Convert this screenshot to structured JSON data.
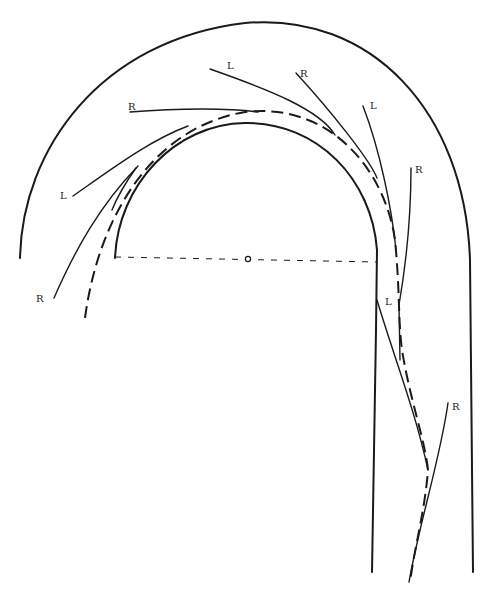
{
  "figure": {
    "type": "track-trajectory-diagram",
    "colors": {
      "line": "#1a1a1a",
      "background": "#ffffff"
    },
    "top_fragment": "",
    "center_marker": {
      "symbol": "circle",
      "x": 248,
      "y": 259
    },
    "labels": [
      {
        "id": "label-r-upper-left",
        "text": "R",
        "x": 128,
        "y": 110
      },
      {
        "id": "label-l-top",
        "text": "L",
        "x": 227,
        "y": 69
      },
      {
        "id": "label-r-top",
        "text": "R",
        "x": 300,
        "y": 77
      },
      {
        "id": "label-l-upper-right",
        "text": "L",
        "x": 370,
        "y": 109
      },
      {
        "id": "label-r-right",
        "text": "R",
        "x": 415,
        "y": 173
      },
      {
        "id": "label-l-left",
        "text": "L",
        "x": 60,
        "y": 199
      },
      {
        "id": "label-r-left",
        "text": "R",
        "x": 36,
        "y": 302
      },
      {
        "id": "label-l-lower-right",
        "text": "L",
        "x": 385,
        "y": 305
      },
      {
        "id": "label-r-lower-right",
        "text": "R",
        "x": 452,
        "y": 410
      }
    ],
    "legend": {
      "solid_thick": "track boundary",
      "dashed_thick": "trajectory",
      "dashed_thin": "radius / centerline",
      "solid_thin": "tangent paths labeled L (left) / R (right)"
    }
  }
}
